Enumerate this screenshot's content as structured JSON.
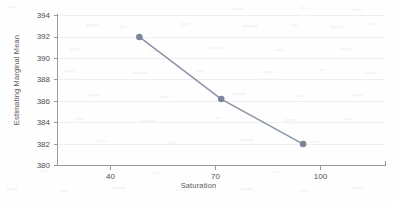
{
  "chart_data": {
    "type": "line",
    "title": "",
    "subtitle": "",
    "xlabel": "Saturation",
    "ylabel": "Estimating Marginal Mean",
    "categories": [
      "40",
      "70",
      "100"
    ],
    "x": [
      40,
      70,
      100
    ],
    "values": [
      392.0,
      386.2,
      382.0
    ],
    "series": [
      {
        "name": "Estimating Marginal Mean",
        "values": [
          392.0,
          386.2,
          382.0
        ]
      }
    ],
    "ylim": [
      380,
      394
    ],
    "y_ticks": [
      "380",
      "382",
      "384",
      "386",
      "388",
      "390",
      "392",
      "394"
    ],
    "y_tick_values": [
      380,
      382,
      384,
      386,
      388,
      390,
      392,
      394
    ],
    "x_ticks": [
      "40",
      "70",
      "100"
    ],
    "grid": "horizontal",
    "legend": "none",
    "annotations": [],
    "marker": "circle",
    "colors": {
      "line": "#8b93a6",
      "marker": "#7d8598",
      "gridline": "#eceef1",
      "axis": "#9a9a9a",
      "text": "#4f4f4f",
      "background": "#fefefe"
    }
  }
}
